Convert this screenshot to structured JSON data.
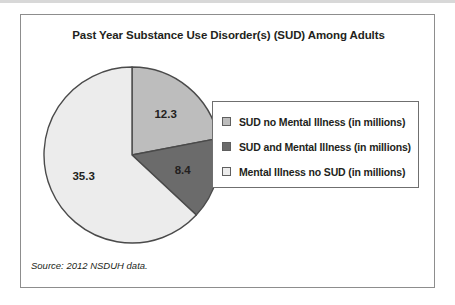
{
  "figure": {
    "title": "Past Year Substance Use Disorder(s) (SUD) Among Adults",
    "source_note": "Source: 2012 NSDUH data.",
    "frame_color": "#8d8d8d",
    "text_color": "#231f20"
  },
  "legend": {
    "items": [
      {
        "label": "SUD no Mental Illness (in millions)",
        "color": "#bdbdbd",
        "swatch_name": "legend-swatch-sud-no-mi"
      },
      {
        "label": "SUD and Mental Illness (in millions)",
        "color": "#6b6b6b",
        "swatch_name": "legend-swatch-sud-and-mi"
      },
      {
        "label": "Mental Illness no SUD (in millions)",
        "color": "#ececec",
        "swatch_name": "legend-swatch-mi-no-sud"
      }
    ]
  },
  "chart_data": {
    "type": "pie",
    "title": "Past Year Substance Use Disorder(s) (SUD) Among Adults",
    "unit": "millions",
    "total": 56.0,
    "start_angle_deg": 0,
    "direction": "clockwise",
    "legend_position": "right",
    "grid": false,
    "categories": [
      "SUD no Mental Illness (in millions)",
      "SUD and Mental Illness (in millions)",
      "Mental Illness no SUD (in millions)"
    ],
    "values": [
      12.3,
      8.4,
      35.3
    ],
    "labels": [
      "12.3",
      "8.4",
      "35.3"
    ],
    "colors": [
      "#bdbdbd",
      "#6b6b6b",
      "#ececec"
    ],
    "slice_angles_deg": [
      79.1,
      54.0,
      226.9
    ],
    "percentages": [
      22.0,
      15.0,
      63.0
    ],
    "slices": [
      {
        "name": "SUD no Mental Illness (in millions)",
        "value": 12.3,
        "label": "12.3",
        "color": "#bdbdbd",
        "angle_deg": 79.1
      },
      {
        "name": "SUD and Mental Illness (in millions)",
        "value": 8.4,
        "label": "8.4",
        "color": "#6b6b6b",
        "angle_deg": 54.0
      },
      {
        "name": "Mental Illness no SUD (in millions)",
        "value": 35.3,
        "label": "35.3",
        "color": "#ececec",
        "angle_deg": 226.9
      }
    ],
    "source": "Source: 2012 NSDUH data."
  }
}
